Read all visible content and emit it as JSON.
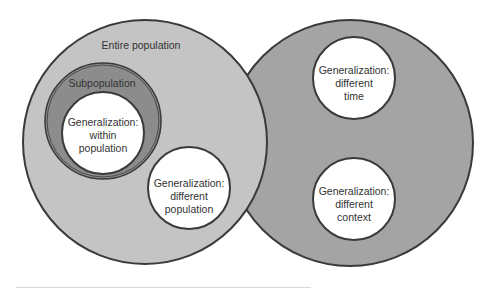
{
  "diagram": {
    "type": "nested-circles",
    "colors": {
      "entire_population_fill": "#c4c4c4",
      "other_fill": "#a4a4a4",
      "subpopulation_fill": "#8c8c8c",
      "inner_fill": "#ffffff",
      "stroke": "#3a3a3a",
      "text": "#333333"
    },
    "left_circle": {
      "label": "Entire population",
      "subpopulation": {
        "label": "Subpopulation",
        "inner": {
          "lines": [
            "Generalization:",
            "within",
            "population"
          ]
        }
      },
      "different_population": {
        "lines": [
          "Generalization:",
          "different",
          "population"
        ]
      }
    },
    "right_circle": {
      "different_time": {
        "lines": [
          "Generalization:",
          "different",
          "time"
        ]
      },
      "different_context": {
        "lines": [
          "Generalization:",
          "different",
          "context"
        ]
      }
    }
  }
}
